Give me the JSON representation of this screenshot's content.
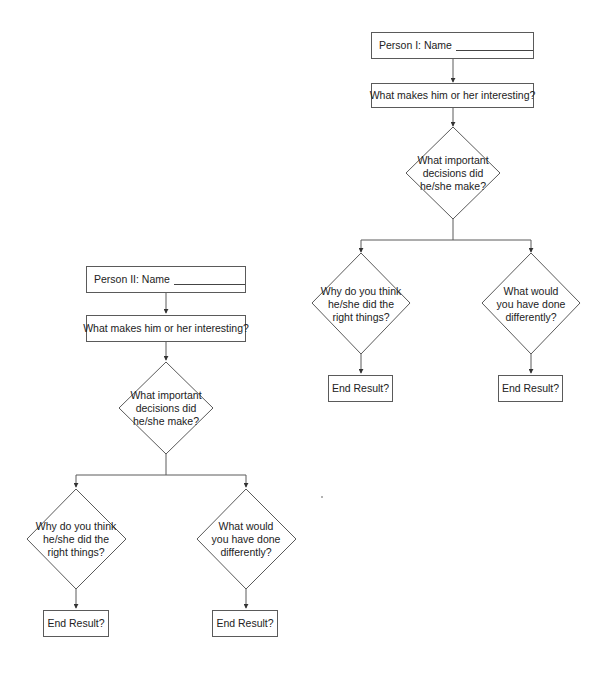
{
  "diagram": {
    "flowcharts": [
      {
        "id": "person-1",
        "name_box": {
          "label": "Person I: Name"
        },
        "interest_box": {
          "label": "What makes him or her interesting?"
        },
        "decision_diamond": {
          "label": "What important\ndecisions did\nhe/she make?"
        },
        "left_diamond": {
          "label": "Why do you think\nhe/she did the\nright things?"
        },
        "right_diamond": {
          "label": "What would\nyou have done\ndifferently?"
        },
        "left_result": {
          "label": "End Result?"
        },
        "right_result": {
          "label": "End Result?"
        }
      },
      {
        "id": "person-2",
        "name_box": {
          "label": "Person II: Name"
        },
        "interest_box": {
          "label": "What makes him or her interesting?"
        },
        "decision_diamond": {
          "label": "What important\ndecisions did\nhe/she make?"
        },
        "left_diamond": {
          "label": "Why do you think\nhe/she did the\nright things?"
        },
        "right_diamond": {
          "label": "What would\nyou have done\ndifferently?"
        },
        "left_result": {
          "label": "End Result?"
        },
        "right_result": {
          "label": "End Result?"
        }
      }
    ],
    "colors": {
      "stroke": "#5a5a5a",
      "text": "#222222",
      "background": "#ffffff"
    }
  }
}
